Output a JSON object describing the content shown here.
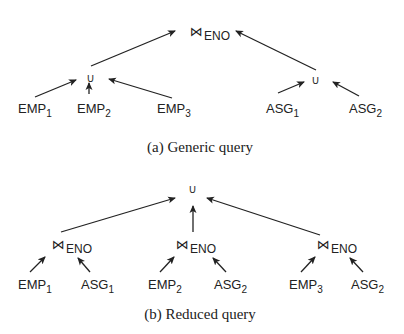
{
  "figure_a": {
    "caption": "(a) Generic query",
    "root": {
      "symbol": "⋈",
      "attribute": "ENO"
    },
    "left_union": {
      "symbol": "∪"
    },
    "right_union": {
      "symbol": "∪"
    },
    "leaves": [
      {
        "name": "EMP",
        "sub": "1"
      },
      {
        "name": "EMP",
        "sub": "2"
      },
      {
        "name": "EMP",
        "sub": "3"
      },
      {
        "name": "ASG",
        "sub": "1"
      },
      {
        "name": "ASG",
        "sub": "2"
      }
    ]
  },
  "figure_b": {
    "caption": "(b) Reduced query",
    "root": {
      "symbol": "∪"
    },
    "joins": [
      {
        "symbol": "⋈",
        "attribute": "ENO"
      },
      {
        "symbol": "⋈",
        "attribute": "ENO"
      },
      {
        "symbol": "⋈",
        "attribute": "ENO"
      }
    ],
    "leaves": [
      {
        "name": "EMP",
        "sub": "1"
      },
      {
        "name": "ASG",
        "sub": "1"
      },
      {
        "name": "EMP",
        "sub": "2"
      },
      {
        "name": "ASG",
        "sub": "2"
      },
      {
        "name": "EMP",
        "sub": "3"
      },
      {
        "name": "ASG",
        "sub": "2"
      }
    ]
  },
  "colors": {
    "line": "#222222",
    "text": "#222222",
    "background": "#ffffff"
  }
}
